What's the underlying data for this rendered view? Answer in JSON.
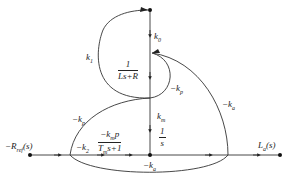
{
  "diagram": {
    "type": "signal-flow-graph",
    "input": "-R_ref(s)",
    "input_label": "−R",
    "input_sub": "ref",
    "input_suffix": "(s)",
    "output_label": "L",
    "output_sub": "a",
    "output_suffix": "(s)",
    "branches": {
      "k1": {
        "k": "k",
        "sub": "1"
      },
      "k0": {
        "k": "k",
        "sub": "0"
      },
      "kp_upper": {
        "k": "−k",
        "sub": "p"
      },
      "ka_right": {
        "k": "−k",
        "sub": "a"
      },
      "kp_left": {
        "k": "−k",
        "sub": "p"
      },
      "k2": {
        "k": "−k",
        "sub": "2"
      },
      "km": {
        "k": "k",
        "sub": "m"
      },
      "ka_bottom": {
        "k": "−k",
        "sub": "a"
      }
    },
    "transfer_functions": {
      "electrical": {
        "num": "1",
        "den": "Ls+R"
      },
      "integrator": {
        "num": "1",
        "den": "s"
      },
      "mechanical": {
        "num_k": "−k",
        "num_sub": "m",
        "num_suffix": "p",
        "den_T": "T",
        "den_sub": "m",
        "den_suffix": "s+1"
      }
    }
  }
}
